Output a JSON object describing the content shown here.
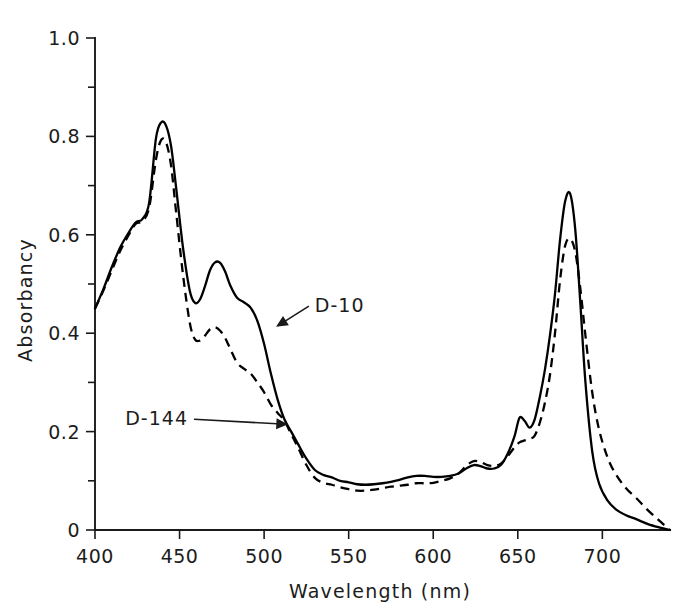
{
  "figure": {
    "background_color": "#ffffff",
    "ink_color": "#000000"
  },
  "chart_data": {
    "type": "line",
    "title": "",
    "subtitle": "",
    "xlabel": "Wavelength (nm)",
    "ylabel": "Absorbancy",
    "xlim": [
      400,
      740
    ],
    "ylim": [
      0,
      1.0
    ],
    "grid": false,
    "legend_position": "inline-annotations",
    "x_ticks": [
      400,
      450,
      500,
      550,
      600,
      650,
      700
    ],
    "x_tick_labels": [
      "400",
      "450",
      "500",
      "550",
      "600",
      "650",
      "700"
    ],
    "x_minor_tick_interval": 50,
    "y_ticks": [
      0,
      0.2,
      0.4,
      0.6,
      0.8,
      1.0
    ],
    "y_tick_labels": [
      "0",
      "0.2",
      "0.4",
      "0.6",
      "0.8",
      "1.0"
    ],
    "y_minor_tick_interval": 0.1,
    "annotations": [
      {
        "text": "D-10",
        "x": 530,
        "y": 0.455,
        "points_to_x": 508,
        "points_to_y": 0.415
      },
      {
        "text": "D-144",
        "x": 455,
        "y": 0.225,
        "points_to_x": 513,
        "points_to_y": 0.215
      }
    ],
    "series": [
      {
        "name": "D-10",
        "style": "solid",
        "color": "#000000",
        "x": [
          400,
          405,
          410,
          415,
          420,
          424,
          428,
          432,
          436,
          439,
          442,
          445,
          448,
          452,
          456,
          459,
          462,
          465,
          468,
          471,
          474,
          477,
          480,
          484,
          488,
          492,
          496,
          500,
          504,
          508,
          512,
          516,
          520,
          525,
          530,
          535,
          540,
          545,
          550,
          555,
          560,
          565,
          570,
          575,
          580,
          585,
          590,
          595,
          600,
          605,
          610,
          615,
          620,
          624,
          628,
          632,
          636,
          640,
          644,
          648,
          651,
          654,
          657,
          660,
          663,
          666,
          669,
          672,
          675,
          678,
          681,
          684,
          687,
          690,
          694,
          698,
          703,
          708,
          714,
          720,
          727,
          734,
          740
        ],
        "y": [
          0.45,
          0.49,
          0.535,
          0.575,
          0.605,
          0.625,
          0.632,
          0.665,
          0.795,
          0.828,
          0.822,
          0.78,
          0.695,
          0.575,
          0.487,
          0.462,
          0.468,
          0.495,
          0.528,
          0.544,
          0.543,
          0.525,
          0.497,
          0.472,
          0.463,
          0.452,
          0.425,
          0.378,
          0.318,
          0.265,
          0.225,
          0.2,
          0.175,
          0.145,
          0.122,
          0.112,
          0.107,
          0.1,
          0.097,
          0.093,
          0.092,
          0.093,
          0.095,
          0.098,
          0.102,
          0.107,
          0.11,
          0.11,
          0.108,
          0.108,
          0.11,
          0.115,
          0.126,
          0.132,
          0.13,
          0.125,
          0.125,
          0.132,
          0.155,
          0.19,
          0.228,
          0.222,
          0.208,
          0.225,
          0.27,
          0.325,
          0.395,
          0.48,
          0.59,
          0.668,
          0.683,
          0.61,
          0.46,
          0.3,
          0.16,
          0.095,
          0.06,
          0.042,
          0.03,
          0.022,
          0.012,
          0.005,
          0.0
        ]
      },
      {
        "name": "D-144",
        "style": "dashed",
        "color": "#000000",
        "x": [
          400,
          405,
          410,
          415,
          420,
          424,
          428,
          432,
          436,
          439,
          442,
          445,
          448,
          452,
          456,
          459,
          462,
          465,
          468,
          471,
          474,
          477,
          480,
          484,
          488,
          492,
          496,
          500,
          504,
          508,
          512,
          516,
          520,
          525,
          530,
          535,
          540,
          545,
          550,
          555,
          560,
          565,
          570,
          575,
          580,
          585,
          590,
          595,
          600,
          605,
          610,
          615,
          620,
          624,
          628,
          632,
          636,
          640,
          644,
          648,
          651,
          654,
          657,
          660,
          663,
          666,
          669,
          672,
          675,
          678,
          681,
          684,
          687,
          690,
          694,
          698,
          703,
          708,
          714,
          720,
          727,
          734,
          740
        ],
        "y": [
          0.45,
          0.487,
          0.528,
          0.568,
          0.6,
          0.622,
          0.628,
          0.655,
          0.752,
          0.792,
          0.788,
          0.74,
          0.645,
          0.52,
          0.422,
          0.388,
          0.385,
          0.395,
          0.408,
          0.412,
          0.405,
          0.39,
          0.368,
          0.34,
          0.328,
          0.318,
          0.3,
          0.28,
          0.255,
          0.238,
          0.222,
          0.195,
          0.168,
          0.132,
          0.106,
          0.096,
          0.092,
          0.087,
          0.083,
          0.08,
          0.08,
          0.082,
          0.085,
          0.088,
          0.09,
          0.092,
          0.095,
          0.095,
          0.096,
          0.1,
          0.105,
          0.115,
          0.132,
          0.14,
          0.138,
          0.132,
          0.13,
          0.135,
          0.15,
          0.168,
          0.178,
          0.182,
          0.185,
          0.192,
          0.218,
          0.258,
          0.315,
          0.4,
          0.508,
          0.578,
          0.592,
          0.565,
          0.49,
          0.395,
          0.28,
          0.205,
          0.148,
          0.113,
          0.085,
          0.065,
          0.04,
          0.018,
          0.0
        ]
      }
    ]
  }
}
